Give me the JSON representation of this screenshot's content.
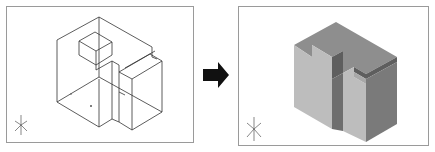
{
  "figure": {
    "left_view": {
      "label": "wireframe-isometric-view",
      "ucs_axes": [
        "X",
        "Y",
        "Z"
      ],
      "line_color": "#333333"
    },
    "transition": {
      "icon": "arrow-right-icon",
      "color": "#111111"
    },
    "right_view": {
      "label": "shaded-solid-isometric-view",
      "ucs_axes": [
        "X",
        "Y",
        "Z"
      ],
      "face_colors": {
        "top": "#8e8e8e",
        "left": "#bdbdbd",
        "right": "#7a7a7a",
        "notch_dark": "#5e5e5e"
      }
    }
  }
}
